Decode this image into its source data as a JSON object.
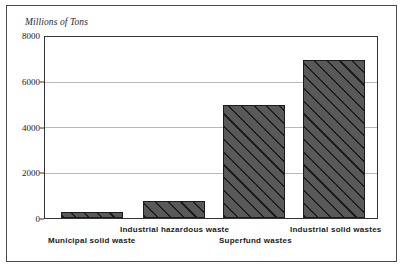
{
  "figure": {
    "axis_title": "Millions of Tons",
    "frame_color": "#4a4a4a",
    "plot_border_color": "#333333",
    "grid_color": "#b9b9b9",
    "bar_fill_color": "#59595a",
    "bar_edge_color": "#1c1c1c",
    "background_color": "#ffffff"
  },
  "chart_data": {
    "type": "bar",
    "title": "",
    "subtitle": "",
    "xlabel": "",
    "ylabel": "Millions of Tons",
    "categories": [
      "Municipal solid waste",
      "Industrial hazardous waste",
      "Superfund wastes",
      "Industrial solid wastes"
    ],
    "values": [
      250,
      750,
      5000,
      7000
    ],
    "ylim": [
      0,
      8000
    ],
    "yticks": [
      0,
      2000,
      4000,
      6000,
      8000
    ],
    "ytick_labels": [
      "0",
      "2000",
      "4000",
      "6000",
      "8000"
    ],
    "grid": "horizontal",
    "legend": "none",
    "annotations": []
  },
  "ticks": {
    "t0": "0",
    "t1": "2000",
    "t2": "4000",
    "t3": "6000",
    "t4": "8000"
  },
  "labels": {
    "cat0": "Municipal solid waste",
    "cat1": "Industrial hazardous waste",
    "cat2": "Superfund wastes",
    "cat3": "Industrial solid wastes"
  }
}
